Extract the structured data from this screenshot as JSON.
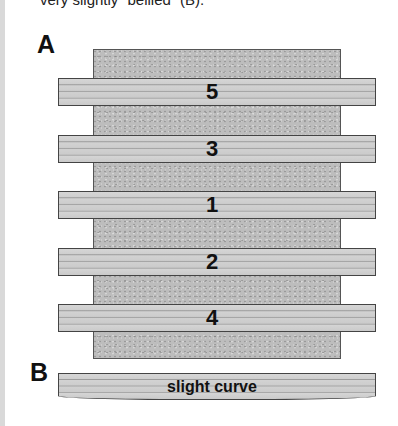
{
  "caption": {
    "partial_text": "very slightly “bellied” (B)."
  },
  "figure": {
    "panel_a": {
      "label": "A",
      "stone_block": "sharpening-stone",
      "strips": [
        {
          "label": "5"
        },
        {
          "label": "3"
        },
        {
          "label": "1"
        },
        {
          "label": "2"
        },
        {
          "label": "4"
        }
      ]
    },
    "panel_b": {
      "label": "B",
      "strip_label": "slight curve"
    }
  },
  "colors": {
    "stone": "#bdbdbd",
    "strip": "#cfcfcf",
    "outline": "#444444",
    "text": "#111111"
  }
}
